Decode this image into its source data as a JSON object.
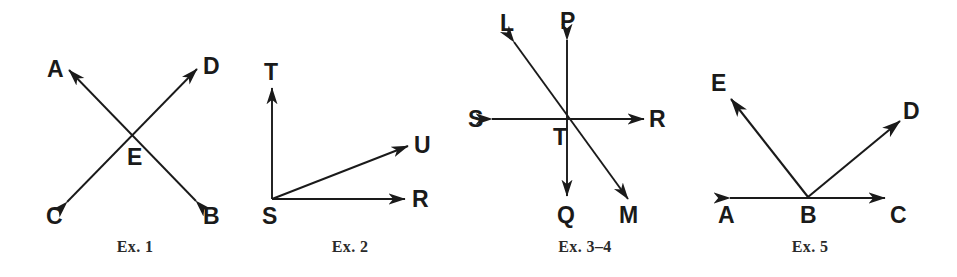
{
  "document": {
    "type": "geometry-exercise-figures",
    "background_color": "#ffffff",
    "ink_color": "#1a1a1a",
    "figure_count": 4
  },
  "figures": [
    {
      "id": "ex1",
      "caption": "Ex. 1",
      "description": "Two straight lines crossing at point E forming vertical angles",
      "vertex_label": "E",
      "point_labels": [
        "A",
        "D",
        "E",
        "C",
        "B"
      ],
      "lines": [
        {
          "name": "line-AB",
          "from": "A",
          "to": "B",
          "arrows": "both"
        },
        {
          "name": "line-CD",
          "from": "C",
          "to": "D",
          "arrows": "both"
        }
      ]
    },
    {
      "id": "ex2",
      "caption": "Ex. 2",
      "description": "Three rays from common endpoint S",
      "vertex_label": "S",
      "point_labels": [
        "T",
        "U",
        "S",
        "R"
      ],
      "lines": [
        {
          "name": "ray-ST",
          "from": "S",
          "to": "T",
          "arrows": "end"
        },
        {
          "name": "ray-SU",
          "from": "S",
          "to": "U",
          "arrows": "end"
        },
        {
          "name": "ray-SR",
          "from": "S",
          "to": "R",
          "arrows": "end"
        }
      ]
    },
    {
      "id": "ex34",
      "caption": "Ex. 3–4",
      "description": "Three straight lines crossing at point T",
      "vertex_label": "T",
      "point_labels": [
        "L",
        "P",
        "S",
        "T",
        "R",
        "Q",
        "M"
      ],
      "lines": [
        {
          "name": "line-SR",
          "from": "S",
          "to": "R",
          "arrows": "both"
        },
        {
          "name": "line-PQ",
          "from": "P",
          "to": "Q",
          "arrows": "both"
        },
        {
          "name": "line-LM",
          "from": "L",
          "to": "M",
          "arrows": "both"
        }
      ]
    },
    {
      "id": "ex5",
      "caption": "Ex. 5",
      "description": "Line AC with two rays BE and BD drawn from point B",
      "vertex_label": "B",
      "point_labels": [
        "E",
        "D",
        "A",
        "B",
        "C"
      ],
      "lines": [
        {
          "name": "line-AC",
          "from": "A",
          "to": "C",
          "arrows": "both"
        },
        {
          "name": "ray-BE",
          "from": "B",
          "to": "E",
          "arrows": "end"
        },
        {
          "name": "ray-BD",
          "from": "B",
          "to": "D",
          "arrows": "end"
        }
      ]
    }
  ],
  "labels": {
    "ex1": {
      "A": "A",
      "D": "D",
      "E": "E",
      "C": "C",
      "B": "B"
    },
    "ex2": {
      "T": "T",
      "U": "U",
      "S": "S",
      "R": "R"
    },
    "ex34": {
      "L": "L",
      "P": "P",
      "S": "S",
      "T": "T",
      "R": "R",
      "Q": "Q",
      "M": "M"
    },
    "ex5": {
      "E": "E",
      "D": "D",
      "A": "A",
      "B": "B",
      "C": "C"
    }
  },
  "captions": {
    "ex1": "Ex. 1",
    "ex2": "Ex. 2",
    "ex34": "Ex. 3–4",
    "ex5": "Ex. 5"
  }
}
